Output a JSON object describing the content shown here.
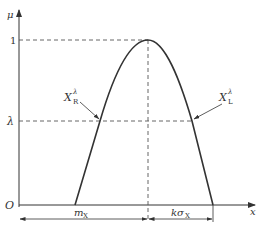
{
  "diagram": {
    "type": "membership-function",
    "axes": {
      "y_label": "μ",
      "x_label": "x",
      "origin_label": "O",
      "y_tick_one": "1",
      "y_tick_lambda": "λ"
    },
    "curve_labels": {
      "right_point": {
        "main": "X",
        "sub": "R",
        "sup": "λ"
      },
      "left_point": {
        "main": "X",
        "sub": "L",
        "sup": "λ"
      }
    },
    "dimensions": {
      "mean": {
        "main": "m",
        "sub": "X"
      },
      "spread": {
        "main": "kσ",
        "sub": "X"
      }
    },
    "colors": {
      "line": "#333333",
      "dashed": "#555555"
    }
  }
}
